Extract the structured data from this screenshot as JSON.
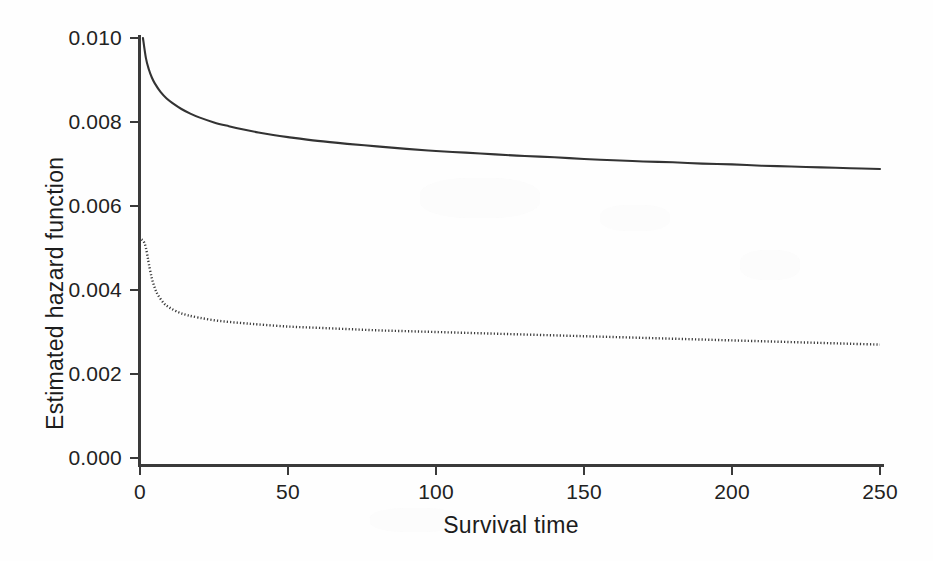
{
  "chart_data": {
    "type": "line",
    "title": "",
    "xlabel": "Survival time",
    "ylabel": "Estimated hazard function",
    "xlim": [
      0,
      250
    ],
    "ylim": [
      0.0,
      0.01
    ],
    "xticks": [
      0,
      50,
      100,
      150,
      200,
      250
    ],
    "xtick_labels": [
      "0",
      "50",
      "100",
      "150",
      "200",
      "250"
    ],
    "yticks": [
      0.0,
      0.002,
      0.004,
      0.006,
      0.008,
      0.01
    ],
    "ytick_labels": [
      "0.000",
      "0.002",
      "0.004",
      "0.006",
      "0.008",
      "0.010"
    ],
    "grid": false,
    "legend": false,
    "legend_position": "none",
    "series": [
      {
        "name": "solid-hazard-curve",
        "style": "solid",
        "color": "#333333",
        "x": [
          1,
          2,
          3,
          4,
          5,
          7,
          9,
          11,
          14,
          17,
          20,
          25,
          30,
          35,
          40,
          45,
          50,
          60,
          70,
          80,
          90,
          100,
          110,
          120,
          130,
          140,
          150,
          160,
          170,
          180,
          190,
          200,
          210,
          220,
          230,
          240,
          250
        ],
        "y": [
          0.01,
          0.00952,
          0.00925,
          0.00906,
          0.00892,
          0.00871,
          0.00856,
          0.00845,
          0.00831,
          0.0082,
          0.00811,
          0.00799,
          0.0079,
          0.00782,
          0.00775,
          0.00769,
          0.00764,
          0.00755,
          0.00748,
          0.00742,
          0.00736,
          0.00731,
          0.00727,
          0.00723,
          0.00719,
          0.00716,
          0.00712,
          0.00709,
          0.00706,
          0.00704,
          0.00701,
          0.00699,
          0.00696,
          0.00694,
          0.00692,
          0.0069,
          0.00688
        ]
      },
      {
        "name": "dotted-hazard-curve",
        "style": "dotted",
        "color": "#3a3a3a",
        "x": [
          0.5,
          1,
          1.5,
          2,
          2.5,
          3,
          4,
          5,
          6,
          8,
          10,
          13,
          16,
          20,
          25,
          30,
          35,
          40,
          50,
          60,
          70,
          80,
          90,
          100,
          110,
          120,
          130,
          140,
          150,
          160,
          170,
          180,
          190,
          200,
          210,
          220,
          230,
          240,
          250
        ],
        "y": [
          0.0052,
          0.00518,
          0.00512,
          0.005,
          0.00482,
          0.00462,
          0.00428,
          0.00405,
          0.00389,
          0.00369,
          0.00358,
          0.00347,
          0.0034,
          0.00334,
          0.00328,
          0.00324,
          0.00321,
          0.00318,
          0.00313,
          0.0031,
          0.00307,
          0.00304,
          0.00302,
          0.003,
          0.00298,
          0.00296,
          0.00294,
          0.00292,
          0.0029,
          0.00288,
          0.00286,
          0.00284,
          0.00282,
          0.0028,
          0.00278,
          0.00276,
          0.00274,
          0.00272,
          0.0027
        ]
      }
    ]
  },
  "axes": {
    "x_title": "Survival time",
    "y_title": "Estimated hazard function"
  }
}
